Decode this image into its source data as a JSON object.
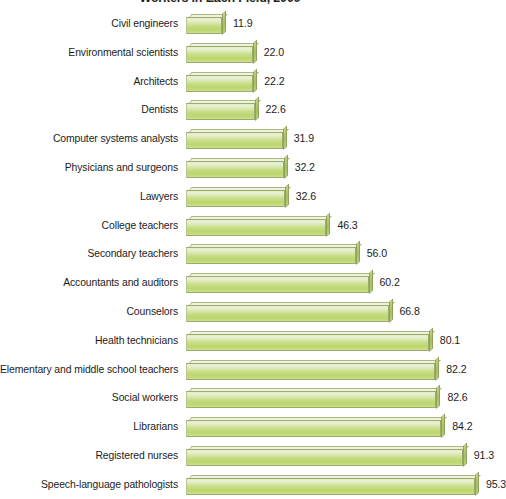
{
  "chart_data": {
    "type": "bar",
    "orientation": "horizontal",
    "title": "Workers in Each Field, 2009",
    "xlabel": "",
    "ylabel": "",
    "xlim": [
      0,
      100
    ],
    "grid": false,
    "legend": null,
    "value_format": "one-decimal",
    "categories": [
      "Civil engineers",
      "Environmental scientists",
      "Architects",
      "Dentists",
      "Computer systems analysts",
      "Physicians and surgeons",
      "Lawyers",
      "College teachers",
      "Secondary teachers",
      "Accountants and auditors",
      "Counselors",
      "Health technicians",
      "Elementary and middle school teachers",
      "Social workers",
      "Librarians",
      "Registered nurses",
      "Speech-language pathologists"
    ],
    "values": [
      11.9,
      22.0,
      22.2,
      22.6,
      31.9,
      32.2,
      32.6,
      46.3,
      56.0,
      60.2,
      66.8,
      80.1,
      82.2,
      82.6,
      84.2,
      91.3,
      95.3
    ],
    "value_labels": [
      "11.9",
      "22.0",
      "22.2",
      "22.6",
      "31.9",
      "32.2",
      "32.6",
      "46.3",
      "56.0",
      "60.2",
      "66.8",
      "80.1",
      "82.2",
      "82.6",
      "84.2",
      "91.3",
      "95.3"
    ],
    "colors": {
      "bar_face_light": "#eaf0d6",
      "bar_face_mid": "#c8dd84",
      "bar_face_deep": "#bcd66e",
      "bar_top": "#eef3dd",
      "bar_side": "#a8bf5f",
      "bar_outline": "#9aab6b",
      "text": "#1c1c1c",
      "title": "#231f20",
      "background": "#ffffff"
    }
  }
}
